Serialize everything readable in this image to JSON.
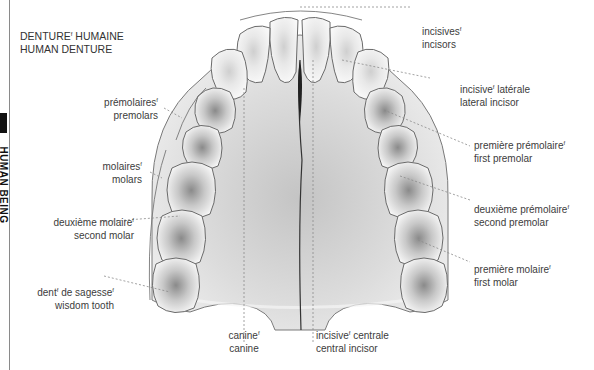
{
  "sidebar": {
    "label": "HUMAN BEING"
  },
  "title": {
    "line_fr": "DENTURE",
    "gender": "f",
    "line_fr_rest": " HUMAINE",
    "line_en": "HUMAN DENTURE"
  },
  "labels": {
    "incisors": {
      "fr": "incisives",
      "gender": "f",
      "en": "incisors"
    },
    "lateral_incisor": {
      "fr": "incisive",
      "gender": "f",
      "fr_rest": " latérale",
      "en": "lateral incisor"
    },
    "premolars": {
      "fr": "prémolaires",
      "gender": "f",
      "en": "premolars"
    },
    "first_premolar": {
      "fr": "première prémolaire",
      "gender": "f",
      "en": "first premolar"
    },
    "molars": {
      "fr": "molaires",
      "gender": "f",
      "en": "molars"
    },
    "second_premolar": {
      "fr": "deuxième prémolaire",
      "gender": "f",
      "en": "second premolar"
    },
    "second_molar": {
      "fr": "deuxième molaire",
      "gender": "f",
      "en": "second molar"
    },
    "first_molar": {
      "fr": "première molaire",
      "gender": "f",
      "en": "first molar"
    },
    "wisdom_tooth": {
      "fr": "dent",
      "gender": "f",
      "fr_mid": " de sagesse",
      "gender2": "f",
      "en": "wisdom tooth"
    },
    "canine": {
      "fr": "canine",
      "gender": "f",
      "en": "canine"
    },
    "central_incisor": {
      "fr": "incisive",
      "gender": "f",
      "fr_rest": " centrale",
      "en": "central incisor"
    }
  },
  "colors": {
    "palate": "#d9d9d9",
    "tooth": "#f4f4f4",
    "outline": "#6a6a6a",
    "leader": "#8a8a8a"
  }
}
